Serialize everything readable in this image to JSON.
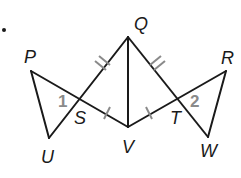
{
  "diagram": {
    "bullet": "•",
    "vertices": {
      "P": {
        "label": "P",
        "x": 31,
        "y": 71
      },
      "Q": {
        "label": "Q",
        "x": 128,
        "y": 37
      },
      "R": {
        "label": "R",
        "x": 226,
        "y": 71
      },
      "S": {
        "label": "S",
        "x": 80,
        "y": 99
      },
      "T": {
        "label": "T",
        "x": 178,
        "y": 99
      },
      "U": {
        "label": "U",
        "x": 49,
        "y": 138
      },
      "V": {
        "label": "V",
        "x": 128,
        "y": 127
      },
      "W": {
        "label": "W",
        "x": 208,
        "y": 137
      }
    },
    "angles": {
      "angle1": {
        "label": "1"
      },
      "angle2": {
        "label": "2"
      }
    },
    "segments": [
      "PU",
      "PV",
      "QU",
      "QV",
      "QW",
      "RV",
      "RW"
    ],
    "congruence_marks": {
      "double_tick": [
        "QS",
        "QT"
      ],
      "single_tick": [
        "SV",
        "VT"
      ]
    },
    "colors": {
      "line": "#1a1a1a",
      "tick": "#8a8a8a",
      "angle_number": "#8a8a8a"
    }
  }
}
